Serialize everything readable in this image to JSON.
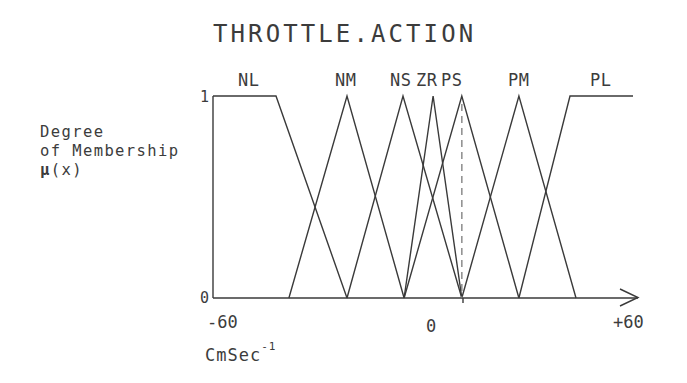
{
  "chart_data": {
    "type": "line",
    "title": "THROTTLE.ACTION",
    "xlabel": "CmSec",
    "xlabel_superscript": "-1",
    "ylabel_lines": [
      "Degree",
      "of Membership",
      "μ(x)"
    ],
    "xlim": [
      -60,
      60
    ],
    "ylim": [
      0,
      1
    ],
    "x_ticks": [
      "-60",
      "0",
      "+60"
    ],
    "y_ticks": [
      "0",
      "1"
    ],
    "grid": false,
    "legend": "none",
    "series": [
      {
        "name": "NL",
        "x": [
          -60,
          -42,
          -21.7
        ],
        "y": [
          1,
          1,
          0
        ]
      },
      {
        "name": "NM",
        "x": [
          -38.3,
          -21.7,
          -5.4
        ],
        "y": [
          0,
          1,
          0
        ]
      },
      {
        "name": "NS",
        "x": [
          -21.7,
          -5.7,
          11.1
        ],
        "y": [
          0,
          1,
          0
        ]
      },
      {
        "name": "ZR",
        "x": [
          -5.4,
          2.9,
          11.1
        ],
        "y": [
          0,
          1,
          0
        ]
      },
      {
        "name": "PS",
        "x": [
          -5.4,
          11.1,
          27.4
        ],
        "y": [
          0,
          1,
          0
        ]
      },
      {
        "name": "PM",
        "x": [
          11.1,
          27.4,
          43.7
        ],
        "y": [
          0,
          1,
          0
        ]
      },
      {
        "name": "PL",
        "x": [
          27.4,
          42,
          60
        ],
        "y": [
          0,
          1,
          1
        ]
      }
    ],
    "annotations": [
      {
        "type": "dashed-vertical-line",
        "x": 11.1,
        "from_y": 0,
        "to_y": 1
      }
    ]
  },
  "labels": {
    "title": "THROTTLE.ACTION",
    "sets": [
      "NL",
      "NM",
      "NS",
      "ZR",
      "PS",
      "PM",
      "PL"
    ],
    "ylabel1": "Degree",
    "ylabel2": "of Membership",
    "ylabel3_mu": "μ",
    "ylabel3_rest": "(x)",
    "ytick_top": "1",
    "ytick_bottom": "0",
    "xtick_min": "-60",
    "xtick_zero": "0",
    "xtick_max": "+60",
    "xunit": "CmSec",
    "xunit_sup": "-1"
  },
  "colors": {
    "line": "#3a3a3a",
    "dashed": "#7a7a7a",
    "background": "#ffffff"
  }
}
